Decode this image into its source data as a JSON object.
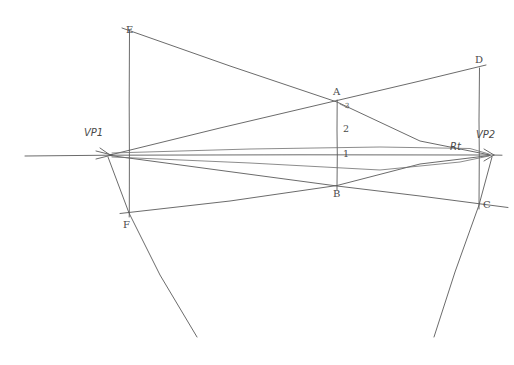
{
  "diagram": {
    "background_color": "#ffffff",
    "ink_color": "#5a5a5a",
    "labels": {
      "vp1": "VP1",
      "vp2": "VP2",
      "rt": "Rt",
      "a": "A",
      "b": "B",
      "c": "C",
      "d": "D",
      "e": "E",
      "f": "F",
      "measure_1": "1",
      "measure_2": "2",
      "measure_3": "3"
    },
    "points": [
      {
        "id": "vp1",
        "label": "VP1",
        "x": 110,
        "y": 155
      },
      {
        "id": "vp2",
        "label": "VP2",
        "x": 490,
        "y": 155
      },
      {
        "id": "a",
        "label": "A",
        "x": 337,
        "y": 100
      },
      {
        "id": "b",
        "label": "B",
        "x": 337,
        "y": 186
      },
      {
        "id": "c",
        "label": "C",
        "x": 479,
        "y": 205
      },
      {
        "id": "d",
        "label": "D",
        "x": 479,
        "y": 68
      },
      {
        "id": "e",
        "label": "E",
        "x": 129,
        "y": 30
      },
      {
        "id": "f",
        "label": "F",
        "x": 129,
        "y": 213
      }
    ],
    "horizon": {
      "y": 155,
      "x_start": 25,
      "x_end": 502
    },
    "verticals": [
      {
        "id": "ab",
        "x": 337,
        "y_top": 100,
        "y_bottom": 190
      },
      {
        "id": "ef",
        "x": 129,
        "y_top": 30,
        "y_bottom": 217
      },
      {
        "id": "dc",
        "x": 479,
        "y_top": 68,
        "y_bottom": 209
      }
    ]
  }
}
